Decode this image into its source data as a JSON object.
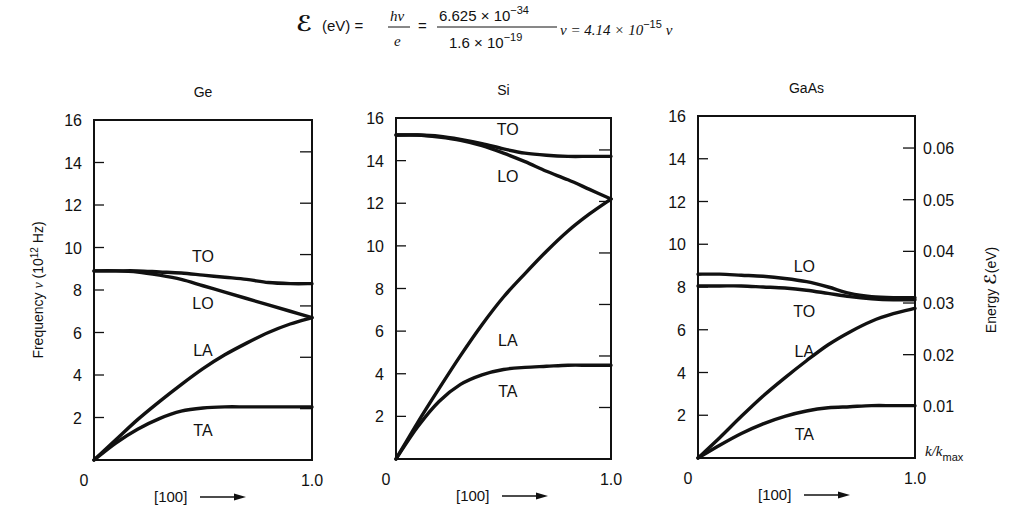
{
  "formula": {
    "lhs_symbol": "ℰ",
    "lhs_unit": "(eV) =",
    "frac1_num": "hν",
    "frac1_den": "e",
    "equals": "=",
    "frac2_num_mant": "6.625 × 10",
    "frac2_num_exp": "−34",
    "frac2_den_mant": "1.6 × 10",
    "frac2_den_exp": "−19",
    "after_frac2": "ν = 4.14 × 10",
    "result_exp": "−15",
    "result_var": "ν"
  },
  "axes": {
    "ylabel": "Frequency ν (10¹² Hz)",
    "ylabel_main": "Frequency ",
    "ylabel_nu": "ν",
    "ylabel_unit_pre": " (10",
    "ylabel_unit_exp": "12",
    "ylabel_unit_post": " Hz)",
    "y2label_pre": "Energy  ",
    "y2label_sym": "ℰ",
    "y2label_post": "(eV)",
    "xlabel": "[100]",
    "x_end_label": "k/k",
    "x_end_sub": "max",
    "x_tick_start": "0",
    "x_tick_end": "1.0",
    "y_ticks": [
      16,
      14,
      12,
      10,
      8,
      6,
      4,
      2
    ],
    "y2_ticks": [
      "0.06",
      "0.05",
      "0.04",
      "0.03",
      "0.02",
      "0.01"
    ]
  },
  "chart_data": [
    {
      "type": "line",
      "title": "Ge",
      "xlabel": "[100] →",
      "ylabel": "Frequency ν (10¹² Hz)",
      "xlim": [
        0,
        1.0
      ],
      "ylim": [
        0,
        16
      ],
      "x": [
        0,
        0.1,
        0.2,
        0.3,
        0.4,
        0.5,
        0.6,
        0.7,
        0.8,
        0.9,
        1.0
      ],
      "series": [
        {
          "name": "TO",
          "values": [
            8.9,
            8.9,
            8.9,
            8.85,
            8.8,
            8.7,
            8.6,
            8.5,
            8.35,
            8.3,
            8.3
          ]
        },
        {
          "name": "LO",
          "values": [
            8.9,
            8.9,
            8.85,
            8.7,
            8.5,
            8.2,
            7.9,
            7.6,
            7.3,
            7.0,
            6.7
          ]
        },
        {
          "name": "LA",
          "values": [
            0,
            0.95,
            1.9,
            2.75,
            3.55,
            4.3,
            4.95,
            5.5,
            6.0,
            6.4,
            6.7
          ]
        },
        {
          "name": "TA",
          "values": [
            0,
            0.8,
            1.45,
            1.95,
            2.3,
            2.45,
            2.5,
            2.5,
            2.5,
            2.5,
            2.5
          ]
        }
      ],
      "labels": [
        {
          "text": "TO",
          "x": 0.5,
          "y": 9.6
        },
        {
          "text": "LO",
          "x": 0.5,
          "y": 7.4
        },
        {
          "text": "LA",
          "x": 0.5,
          "y": 5.2
        },
        {
          "text": "TA",
          "x": 0.5,
          "y": 1.4
        }
      ]
    },
    {
      "type": "line",
      "title": "Si",
      "xlabel": "[100] →",
      "xlim": [
        0,
        1.0
      ],
      "ylim": [
        0,
        16
      ],
      "x": [
        0,
        0.1,
        0.2,
        0.3,
        0.4,
        0.5,
        0.6,
        0.7,
        0.8,
        0.9,
        1.0
      ],
      "series": [
        {
          "name": "TO",
          "values": [
            15.2,
            15.2,
            15.15,
            15.0,
            14.8,
            14.55,
            14.35,
            14.25,
            14.2,
            14.2,
            14.2
          ]
        },
        {
          "name": "LO",
          "values": [
            15.2,
            15.2,
            15.1,
            14.95,
            14.7,
            14.35,
            13.95,
            13.5,
            13.1,
            12.65,
            12.2
          ]
        },
        {
          "name": "LA",
          "values": [
            0,
            1.7,
            3.3,
            4.85,
            6.3,
            7.6,
            8.7,
            9.75,
            10.7,
            11.5,
            12.2
          ]
        },
        {
          "name": "TA",
          "values": [
            0,
            1.5,
            2.7,
            3.5,
            3.95,
            4.2,
            4.3,
            4.35,
            4.4,
            4.4,
            4.4
          ]
        }
      ],
      "labels": [
        {
          "text": "TO",
          "x": 0.52,
          "y": 15.5
        },
        {
          "text": "LO",
          "x": 0.52,
          "y": 13.3
        },
        {
          "text": "LA",
          "x": 0.52,
          "y": 5.6
        },
        {
          "text": "TA",
          "x": 0.52,
          "y": 3.2
        }
      ]
    },
    {
      "type": "line",
      "title": "GaAs",
      "xlabel": "[100] →",
      "ylabel_right": "Energy ℰ (eV)",
      "xlim": [
        0,
        1.0
      ],
      "ylim": [
        0,
        16
      ],
      "y2lim": [
        0,
        0.0662
      ],
      "x": [
        0,
        0.1,
        0.2,
        0.3,
        0.4,
        0.5,
        0.6,
        0.7,
        0.8,
        0.9,
        1.0
      ],
      "series": [
        {
          "name": "LO",
          "values": [
            8.6,
            8.6,
            8.55,
            8.5,
            8.4,
            8.25,
            8.0,
            7.7,
            7.55,
            7.5,
            7.5
          ]
        },
        {
          "name": "TO",
          "values": [
            8.05,
            8.05,
            8.05,
            8.0,
            7.95,
            7.85,
            7.7,
            7.55,
            7.45,
            7.4,
            7.4
          ]
        },
        {
          "name": "LA",
          "values": [
            0,
            0.95,
            1.95,
            2.9,
            3.75,
            4.55,
            5.3,
            5.9,
            6.4,
            6.75,
            7.0
          ]
        },
        {
          "name": "TA",
          "values": [
            0,
            0.6,
            1.15,
            1.6,
            1.95,
            2.2,
            2.35,
            2.4,
            2.45,
            2.45,
            2.45
          ]
        }
      ],
      "labels": [
        {
          "text": "LO",
          "x": 0.49,
          "y": 9.0
        },
        {
          "text": "TO",
          "x": 0.49,
          "y": 6.9
        },
        {
          "text": "LA",
          "x": 0.49,
          "y": 5.0
        },
        {
          "text": "TA",
          "x": 0.49,
          "y": 1.1
        }
      ]
    }
  ]
}
